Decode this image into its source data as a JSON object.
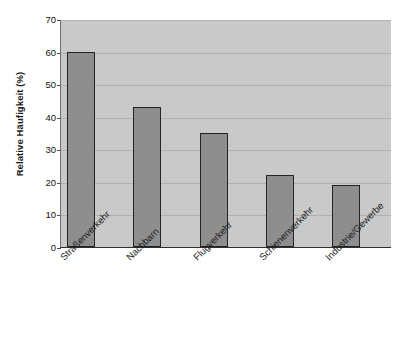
{
  "chart_data": {
    "type": "bar",
    "title": "",
    "subtitle": "",
    "xlabel": "",
    "ylabel": "Relative Häufigkeit (%)",
    "ylim": [
      0,
      70
    ],
    "yticks": [
      0,
      10,
      20,
      30,
      40,
      50,
      60,
      70
    ],
    "ytick_labels": [
      "0",
      "10",
      "20",
      "30",
      "40",
      "50",
      "60",
      "70"
    ],
    "grid": true,
    "grid_axis": "y",
    "legend": false,
    "legend_position": "none",
    "categories": [
      "Straßenverkehr",
      "Nachbarn",
      "Flugverkehr",
      "Schienenverkehr",
      "Industrie/Gewerbe"
    ],
    "values": [
      60,
      43,
      35,
      22,
      19
    ],
    "series": [
      {
        "name": "Relative Häufigkeit",
        "values": [
          60,
          43,
          35,
          22,
          19
        ]
      }
    ],
    "annotations": []
  },
  "style": {
    "plot_background": "#c9c9c9",
    "figure_background": "#ffffff",
    "bar_fill": "#8e8e8e",
    "bar_edge": "#242424",
    "gridline_color": "#b0b0b0",
    "axis_color": "#2f2f2f",
    "text_color": "#1c1c1c"
  }
}
